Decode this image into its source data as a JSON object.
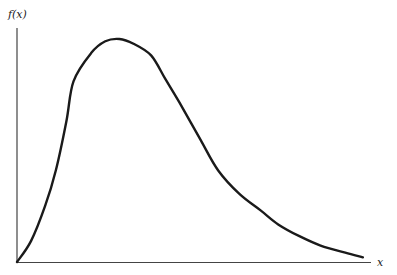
{
  "chart_data": {
    "type": "line",
    "title": "",
    "xlabel": "x",
    "ylabel": "f(x)",
    "grid": false,
    "legend": null,
    "x": [
      0,
      0.04,
      0.08,
      0.11,
      0.14,
      0.16,
      0.21,
      0.25,
      0.29,
      0.33,
      0.38,
      0.42,
      0.46,
      0.52,
      0.57,
      0.63,
      0.69,
      0.74,
      0.8,
      0.86,
      0.93,
      0.98
    ],
    "series": [
      {
        "name": "f(x)",
        "values": [
          0,
          0.09,
          0.24,
          0.39,
          0.6,
          0.77,
          0.89,
          0.94,
          0.95,
          0.93,
          0.88,
          0.78,
          0.68,
          0.52,
          0.39,
          0.29,
          0.22,
          0.16,
          0.11,
          0.07,
          0.04,
          0.02
        ]
      }
    ],
    "xlim": [
      0,
      1
    ],
    "ylim": [
      0,
      1
    ],
    "color": "#1a1a1a"
  },
  "labels": {
    "y_axis": "f(x)",
    "x_axis": "x"
  }
}
